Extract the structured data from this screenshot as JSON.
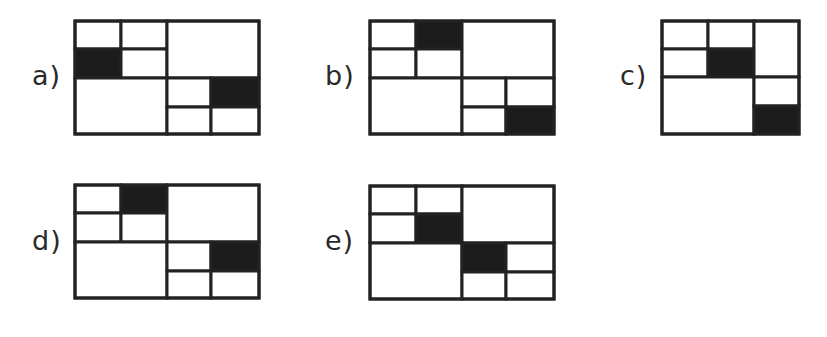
{
  "colors": {
    "stroke": "#222222",
    "fill_dark": "#1c1c1c",
    "fill_light": "#ffffff",
    "label": "#2a2a2a"
  },
  "layouts": {
    "wide": {
      "width": 184,
      "height": 113,
      "cells": {
        "tl-a": [
          0,
          0,
          46,
          28
        ],
        "tl-b": [
          46,
          0,
          92,
          28
        ],
        "tl-c": [
          0,
          28,
          46,
          57
        ],
        "tl-d": [
          46,
          28,
          92,
          57
        ],
        "tr": [
          92,
          0,
          184,
          57
        ],
        "bl": [
          0,
          57,
          92,
          113
        ],
        "br-a": [
          92,
          57,
          136,
          86
        ],
        "br-b": [
          136,
          57,
          184,
          86
        ],
        "br-c": [
          92,
          86,
          136,
          113
        ],
        "br-d": [
          136,
          86,
          184,
          113
        ]
      }
    },
    "narrow": {
      "width": 137,
      "height": 113,
      "cells": {
        "tl-a": [
          0,
          0,
          46,
          28
        ],
        "tl-b": [
          46,
          0,
          92,
          28
        ],
        "tl-c": [
          0,
          28,
          46,
          56
        ],
        "tl-d": [
          46,
          28,
          92,
          56
        ],
        "r-top": [
          92,
          0,
          137,
          56
        ],
        "bl": [
          0,
          56,
          92,
          113
        ],
        "r-mid": [
          92,
          56,
          137,
          85
        ],
        "r-bot": [
          92,
          85,
          137,
          113
        ]
      }
    }
  },
  "options": [
    {
      "id": "a",
      "label": "a)",
      "layout": "wide",
      "label_pos": [
        32,
        62
      ],
      "figure_pos": [
        75,
        21
      ],
      "filled": [
        "tl-c",
        "br-b"
      ]
    },
    {
      "id": "b",
      "label": "b)",
      "layout": "wide",
      "label_pos": [
        325,
        62
      ],
      "figure_pos": [
        370,
        21
      ],
      "filled": [
        "tl-b",
        "br-d"
      ]
    },
    {
      "id": "c",
      "label": "c)",
      "layout": "narrow",
      "label_pos": [
        620,
        62
      ],
      "figure_pos": [
        662,
        21
      ],
      "filled": [
        "tl-d",
        "r-bot"
      ]
    },
    {
      "id": "d",
      "label": "d)",
      "layout": "wide",
      "label_pos": [
        32,
        227
      ],
      "figure_pos": [
        75,
        185
      ],
      "filled": [
        "tl-b",
        "br-b"
      ]
    },
    {
      "id": "e",
      "label": "e)",
      "layout": "wide",
      "label_pos": [
        325,
        227
      ],
      "figure_pos": [
        370,
        186
      ],
      "filled": [
        "tl-d",
        "br-a"
      ]
    }
  ]
}
